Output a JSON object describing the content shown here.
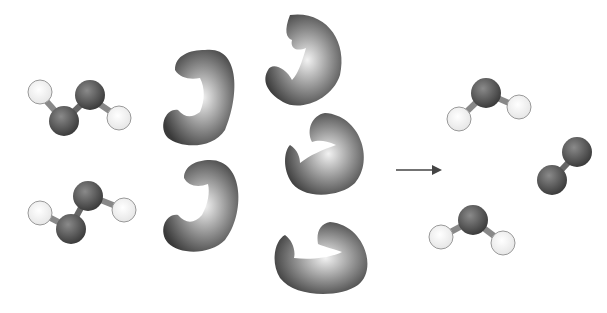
{
  "diagram": {
    "title": "",
    "colors": {
      "background": "#ffffff",
      "atom_dark": "#555555",
      "atom_light": "#ffffff",
      "enzyme": "#4a4a4a",
      "arrow": "#444444"
    },
    "reactants": [
      {
        "name": "hydrogen-peroxide-molecule-1",
        "formula": "H2O2"
      },
      {
        "name": "hydrogen-peroxide-molecule-2",
        "formula": "H2O2"
      }
    ],
    "enzymes": [
      {
        "name": "enzyme-1"
      },
      {
        "name": "enzyme-2"
      },
      {
        "name": "enzyme-3"
      },
      {
        "name": "enzyme-4"
      },
      {
        "name": "enzyme-5"
      }
    ],
    "arrow": {
      "name": "reaction-arrow",
      "direction": "right"
    },
    "products": [
      {
        "name": "water-molecule-1",
        "formula": "H2O"
      },
      {
        "name": "oxygen-molecule",
        "formula": "O2"
      },
      {
        "name": "water-molecule-2",
        "formula": "H2O"
      }
    ]
  }
}
